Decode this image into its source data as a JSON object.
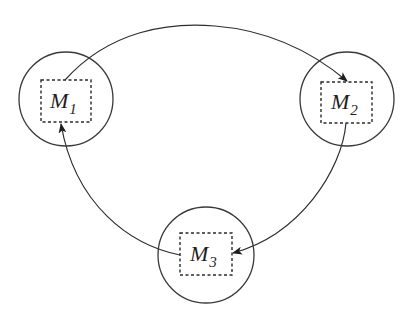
{
  "diagram": {
    "type": "cyclic-process-diagram",
    "nodes": [
      {
        "id": "M1",
        "main": "M",
        "sub": "1",
        "cx": 66,
        "cy": 99,
        "r": 47,
        "box": {
          "x": 41,
          "y": 80,
          "w": 50,
          "h": 42
        }
      },
      {
        "id": "M2",
        "main": "M",
        "sub": "2",
        "cx": 347,
        "cy": 99,
        "r": 47,
        "box": {
          "x": 321,
          "y": 82,
          "w": 51,
          "h": 41
        }
      },
      {
        "id": "M3",
        "main": "M",
        "sub": "3",
        "cx": 206,
        "cy": 255,
        "r": 48,
        "box": {
          "x": 180,
          "y": 233,
          "w": 52,
          "h": 42
        }
      }
    ],
    "edges": [
      {
        "from": "M1",
        "to": "M2"
      },
      {
        "from": "M2",
        "to": "M3"
      },
      {
        "from": "M3",
        "to": "M1"
      }
    ],
    "colors": {
      "stroke": "#2f2f2f",
      "background": "#ffffff"
    }
  }
}
